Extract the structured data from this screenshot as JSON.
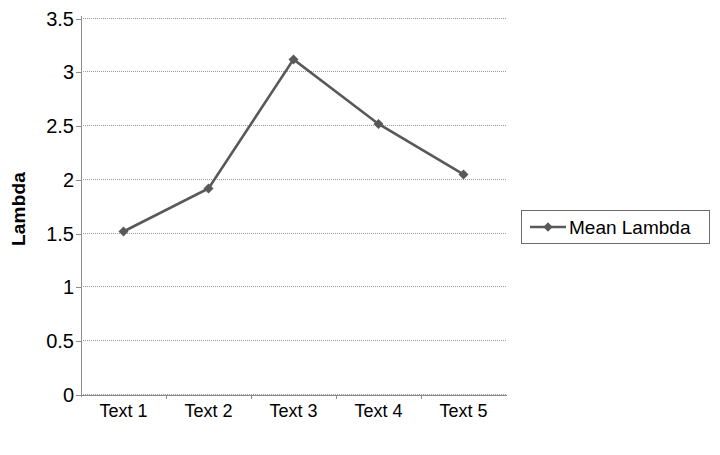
{
  "chart_data": {
    "type": "line",
    "title": "",
    "subtitle": "",
    "xlabel": "",
    "ylabel": "Lambda",
    "categories": [
      "Text 1",
      "Text 2",
      "Text 3",
      "Text 4",
      "Text 5"
    ],
    "series": [
      {
        "name": "Mean Lambda",
        "values": [
          1.52,
          1.92,
          3.12,
          2.52,
          2.05
        ],
        "color": "#595959",
        "marker": "diamond"
      }
    ],
    "ylim": [
      0,
      3.5
    ],
    "y_ticks": [
      0,
      0.5,
      1,
      1.5,
      2,
      2.5,
      3,
      3.5
    ],
    "y_tick_labels": [
      "0",
      "0.5",
      "1",
      "1.5",
      "2",
      "2.5",
      "3",
      "3.5"
    ],
    "grid": true,
    "grid_style": "dotted",
    "grid_axis": "y",
    "legend_position": "right",
    "legend_entries": [
      "Mean Lambda"
    ],
    "background_color": "#ffffff",
    "axis_color": "#8c8c8c",
    "gridline_color": "#9a9a9a",
    "text_color": "#000000"
  },
  "legend": {
    "entries": [
      {
        "label": "Mean Lambda",
        "color": "#595959",
        "marker": "diamond"
      }
    ]
  },
  "axes": {
    "y_title": "Lambda",
    "y_tick_labels": [
      "3.5",
      "3",
      "2.5",
      "2",
      "1.5",
      "1",
      "0.5",
      "0"
    ],
    "x_tick_labels": [
      "Text 1",
      "Text 2",
      "Text 3",
      "Text 4",
      "Text 5"
    ]
  }
}
